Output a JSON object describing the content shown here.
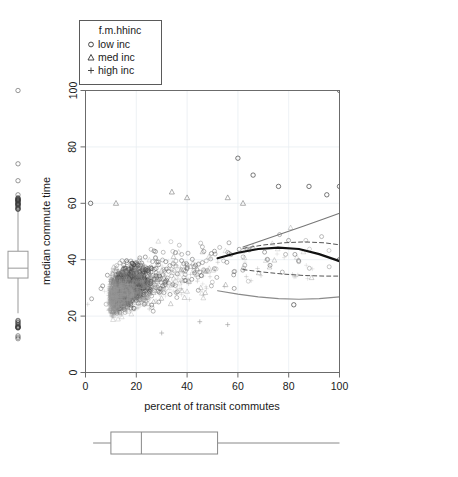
{
  "figure": {
    "type": "scatter-with-marginal-boxplots",
    "background": "#ffffff"
  },
  "legend": {
    "title": "f.m.hhinc",
    "position": "top-left",
    "border_color": "#555555",
    "entries": [
      {
        "symbol": "circle",
        "glyph": "○",
        "label": "low inc"
      },
      {
        "symbol": "triangle",
        "glyph": "△",
        "label": "med inc"
      },
      {
        "symbol": "plus",
        "glyph": "+",
        "label": "high inc"
      }
    ]
  },
  "axes": {
    "x": {
      "label": "percent of transit commutes",
      "ticks": [
        "0",
        "20",
        "40",
        "60",
        "80",
        "100"
      ],
      "min": 0,
      "max": 100
    },
    "y": {
      "label": "median commute time",
      "ticks": [
        "0",
        "20",
        "40",
        "60",
        "80",
        "100"
      ],
      "min": 0,
      "max": 100
    },
    "grid": "on",
    "grid_color": "#e8ecf0",
    "frame_color": "#666666"
  },
  "chart_data": {
    "type": "scatter",
    "title": "",
    "xlabel": "percent of transit commutes",
    "ylabel": "median commute time",
    "xlim": [
      0,
      100
    ],
    "ylim": [
      0,
      100
    ],
    "grid": true,
    "legend_position": "top-left",
    "legend_title": "f.m.hhinc",
    "series": [
      {
        "name": "low inc",
        "marker": "circle",
        "color": "#3a3a3a",
        "n_points": 900,
        "cloud": {
          "x_mode": 12,
          "x_spread": 22,
          "x_tail_max": 100,
          "y_at_x0": 26,
          "y_at_x50": 42,
          "y_at_x100": 40,
          "y_sd": 7
        },
        "notable_points": [
          {
            "x": 100,
            "y": 100
          },
          {
            "x": 60,
            "y": 76
          },
          {
            "x": 66,
            "y": 70
          },
          {
            "x": 76,
            "y": 66
          },
          {
            "x": 88,
            "y": 66
          },
          {
            "x": 100,
            "y": 66
          },
          {
            "x": 95,
            "y": 63
          },
          {
            "x": 2,
            "y": 60
          },
          {
            "x": 100,
            "y": 40
          },
          {
            "x": 82,
            "y": 24
          }
        ]
      },
      {
        "name": "med inc",
        "marker": "triangle",
        "color": "#7a7a7a",
        "n_points": 700,
        "cloud": {
          "x_mode": 10,
          "x_spread": 20,
          "x_tail_max": 95,
          "y_at_x0": 25,
          "y_at_x50": 40,
          "y_at_x100": 44,
          "y_sd": 7
        },
        "notable_points": [
          {
            "x": 34,
            "y": 64
          },
          {
            "x": 40,
            "y": 62
          },
          {
            "x": 56,
            "y": 62
          },
          {
            "x": 12,
            "y": 60
          },
          {
            "x": 62,
            "y": 60
          }
        ]
      },
      {
        "name": "high inc",
        "marker": "plus",
        "color": "#9a9a9a",
        "n_points": 600,
        "cloud": {
          "x_mode": 9,
          "x_spread": 18,
          "x_tail_max": 90,
          "y_at_x0": 24,
          "y_at_x50": 38,
          "y_at_x100": 36,
          "y_sd": 6
        },
        "notable_points": [
          {
            "x": 45,
            "y": 18
          },
          {
            "x": 56,
            "y": 17
          },
          {
            "x": 30,
            "y": 14
          }
        ]
      }
    ],
    "fitted_curves": [
      {
        "name": "overall-fit-solid-dark",
        "style": "solid",
        "width": 2.2,
        "color": "#111111",
        "points": [
          [
            52,
            40.5
          ],
          [
            60,
            42.5
          ],
          [
            68,
            43.8
          ],
          [
            76,
            44.3
          ],
          [
            84,
            43.8
          ],
          [
            92,
            42.0
          ],
          [
            100,
            39.5
          ]
        ]
      },
      {
        "name": "upper-fit-solid-light",
        "style": "solid",
        "width": 1.1,
        "color": "#777777",
        "points": [
          [
            62,
            44.5
          ],
          [
            70,
            47.0
          ],
          [
            78,
            49.5
          ],
          [
            86,
            52.0
          ],
          [
            94,
            54.5
          ],
          [
            100,
            56.5
          ]
        ]
      },
      {
        "name": "upper-band-dashed",
        "style": "dashed",
        "width": 1.0,
        "color": "#555555",
        "points": [
          [
            62,
            44.0
          ],
          [
            70,
            45.2
          ],
          [
            78,
            46.0
          ],
          [
            86,
            46.3
          ],
          [
            94,
            46.0
          ],
          [
            100,
            45.3
          ]
        ]
      },
      {
        "name": "lower-band-dashed",
        "style": "dashed",
        "width": 1.0,
        "color": "#555555",
        "points": [
          [
            62,
            36.5
          ],
          [
            70,
            35.6
          ],
          [
            78,
            34.9
          ],
          [
            86,
            34.4
          ],
          [
            94,
            34.2
          ],
          [
            100,
            34.2
          ]
        ]
      },
      {
        "name": "lower-fit-solid-light",
        "style": "solid",
        "width": 1.1,
        "color": "#8a8a8a",
        "points": [
          [
            52,
            29.0
          ],
          [
            60,
            27.8
          ],
          [
            68,
            26.8
          ],
          [
            76,
            26.2
          ],
          [
            84,
            26.0
          ],
          [
            92,
            26.2
          ],
          [
            100,
            26.8
          ]
        ]
      }
    ]
  },
  "marginal_boxplots": {
    "y_boxplot": {
      "name": "median commute time distribution",
      "orientation": "vertical",
      "q1": 33.5,
      "median": 37.0,
      "q3": 43.0,
      "whisker_low": 21.0,
      "whisker_high": 57.0,
      "outliers_high": [
        100,
        74,
        68,
        63,
        62,
        61.5,
        61,
        60.5,
        60,
        59.5,
        59,
        58.5,
        58.2,
        58
      ],
      "outliers_low": [
        17.5,
        17.0,
        16.5,
        16.0,
        13.0,
        12.5,
        12.0
      ],
      "color": "#999999"
    },
    "x_boxplot": {
      "name": "percent of transit commutes distribution",
      "orientation": "horizontal",
      "q1": 10.0,
      "median": 22.0,
      "q3": 52.0,
      "whisker_low": 3.0,
      "whisker_high": 100.0,
      "color": "#888888"
    }
  }
}
